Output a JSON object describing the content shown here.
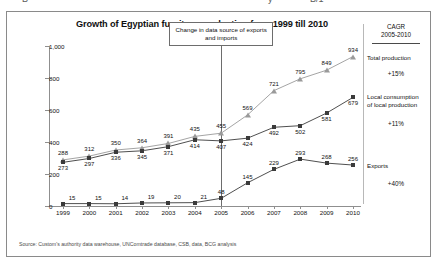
{
  "cut_off_text": [
    {
      "text": "B",
      "x": 22
    },
    {
      "text": "y",
      "x": 268
    },
    {
      "text": "B/1",
      "x": 310
    }
  ],
  "chart": {
    "title": "Growth of Egyptian furniture production from 1999 till 2010",
    "subtitle": "- in M $ -",
    "annotation": "Change in data source of exports and imports",
    "source": "Source: Custom's authority data warehouse, UNComtrade database, CSB, data, BCG analysis"
  },
  "cagr": {
    "header_line1": "CAGR",
    "header_line2": "2005-2010",
    "values": [
      "+15%",
      "+11%",
      "+40%"
    ]
  },
  "chart_data": {
    "type": "line",
    "title": "Growth of Egyptian furniture production from 1999 till 2010",
    "subtitle": "- in M $ -",
    "xlabel": "",
    "ylabel": "M $",
    "ylim": [
      0,
      1000
    ],
    "yticks": [
      "0",
      "200",
      "400",
      "600",
      "800",
      "1,000"
    ],
    "ytick_values": [
      0,
      200,
      400,
      600,
      800,
      1000
    ],
    "grid": false,
    "legend_position": "right-inline",
    "categories": [
      "1999",
      "2000",
      "2001",
      "2002",
      "2003",
      "2004",
      "2005",
      "2006",
      "2007",
      "2008",
      "2009",
      "2010"
    ],
    "x": [
      1999,
      2000,
      2001,
      2002,
      2003,
      2004,
      2005,
      2006,
      2007,
      2008,
      2009,
      2010
    ],
    "annotations": [
      {
        "text": "Change in data source of exports and imports",
        "at_x": 2005
      }
    ],
    "series": [
      {
        "name": "Total production",
        "marker": "triangle",
        "color": "#9a9a9a",
        "values": [
          288,
          312,
          350,
          364,
          391,
          435,
          455,
          569,
          721,
          795,
          849,
          934
        ],
        "cagr_2005_2010": "+15%"
      },
      {
        "name": "Local consumption of local production",
        "marker": "square",
        "color": "#3b3b3b",
        "values": [
          273,
          297,
          336,
          345,
          371,
          414,
          407,
          424,
          492,
          502,
          581,
          679
        ],
        "cagr_2005_2010": "+11%"
      },
      {
        "name": "Exports",
        "marker": "square",
        "color": "#3b3b3b",
        "values": [
          15,
          15,
          14,
          19,
          20,
          21,
          48,
          145,
          229,
          293,
          268,
          256
        ],
        "cagr_2005_2010": "+40%"
      }
    ],
    "series_labels": [
      {
        "line1": "Total production",
        "line2": ""
      },
      {
        "line1": "Local consumption",
        "line2": "of local production"
      },
      {
        "line1": "Exports",
        "line2": ""
      }
    ]
  }
}
